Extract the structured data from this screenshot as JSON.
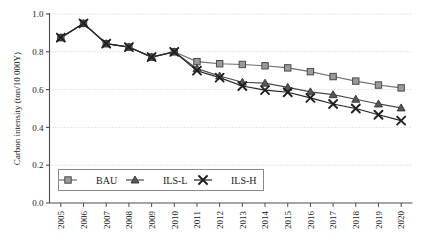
{
  "chart_data": {
    "type": "line",
    "title": "",
    "xlabel": "",
    "ylabel": "Carbon intensity (ton/10 000Y)",
    "categories": [
      "2005",
      "2006",
      "2007",
      "2008",
      "2009",
      "2010",
      "2011",
      "2012",
      "2013",
      "2014",
      "2015",
      "2016",
      "2017",
      "2018",
      "2019",
      "2020"
    ],
    "x": [
      2005,
      2006,
      2007,
      2008,
      2009,
      2010,
      2011,
      2012,
      2013,
      2014,
      2015,
      2016,
      2017,
      2018,
      2019,
      2020
    ],
    "ylim": [
      0.0,
      1.0
    ],
    "ytick_values": [
      0.0,
      0.2,
      0.4,
      0.6,
      0.8,
      1.0
    ],
    "ytick_labels": [
      "0.0",
      "0.2",
      "0.4",
      "0.6",
      "0.8",
      "1.0"
    ],
    "grid": true,
    "grid_style": "dotted-horizontal",
    "legend_position": "lower-left-inside",
    "series": [
      {
        "name": "BAU",
        "marker": "square",
        "color": "#808080",
        "values": [
          0.875,
          0.95,
          0.843,
          0.825,
          0.772,
          0.8,
          0.748,
          0.737,
          0.733,
          0.726,
          0.715,
          0.695,
          0.669,
          0.645,
          0.624,
          0.609
        ]
      },
      {
        "name": "ILS-L",
        "marker": "triangle",
        "color": "#595959",
        "values": [
          0.875,
          0.95,
          0.843,
          0.825,
          0.772,
          0.8,
          0.711,
          0.672,
          0.639,
          0.634,
          0.612,
          0.588,
          0.573,
          0.549,
          0.524,
          0.503
        ]
      },
      {
        "name": "ILS-H",
        "marker": "x",
        "color": "#2b2b2b",
        "values": [
          0.875,
          0.95,
          0.843,
          0.825,
          0.772,
          0.8,
          0.7,
          0.663,
          0.619,
          0.597,
          0.586,
          0.556,
          0.524,
          0.5,
          0.467,
          0.436
        ]
      }
    ],
    "legend": [
      {
        "label": "BAU",
        "marker": "square"
      },
      {
        "label": "ILS-L",
        "marker": "triangle"
      },
      {
        "label": "ILS-H",
        "marker": "x"
      }
    ],
    "colors": {
      "axis": "#4d4d4d",
      "grid": "#bfbfbf",
      "bau": "#808080",
      "ils_l": "#595959",
      "ils_h": "#2b2b2b",
      "text": "#1a1a1a"
    }
  }
}
